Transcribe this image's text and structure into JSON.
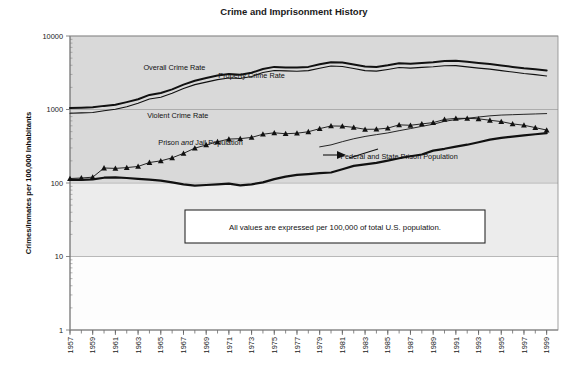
{
  "chart_data": {
    "type": "line",
    "title": "Crime and Imprisonment History",
    "xlabel": "",
    "ylabel": "Crimes/Inmates per 100,000 Inhabitants",
    "yscale": "log",
    "ylim": [
      1,
      10000
    ],
    "ytick_labels": [
      "10000",
      "1000",
      "100",
      "10",
      "1"
    ],
    "ytick_values": [
      10000,
      1000,
      100,
      10,
      1
    ],
    "xlim": [
      1957,
      2000
    ],
    "grid": true,
    "legend_position": "inline-annotations",
    "x": [
      1957,
      1958,
      1959,
      1960,
      1961,
      1962,
      1963,
      1964,
      1965,
      1966,
      1967,
      1968,
      1969,
      1970,
      1971,
      1972,
      1973,
      1974,
      1975,
      1976,
      1977,
      1978,
      1979,
      1980,
      1981,
      1982,
      1983,
      1984,
      1985,
      1986,
      1987,
      1988,
      1989,
      1990,
      1991,
      1992,
      1993,
      1994,
      1995,
      1996,
      1997,
      1998,
      1999
    ],
    "xtick_labels": [
      "1957",
      "1959",
      "1961",
      "1963",
      "1965",
      "1967",
      "1969",
      "1971",
      "1973",
      "1975",
      "1977",
      "1979",
      "1981",
      "1983",
      "1985",
      "1987",
      "1989",
      "1991",
      "1993",
      "1995",
      "1997",
      "1999"
    ],
    "series": [
      {
        "name": "Overall Crime Rate",
        "marker": "none",
        "stroke_width": 2.0,
        "color": "#111111",
        "label_x": 1966.2,
        "label_y": 3450,
        "values": [
          1050,
          1060,
          1070,
          1120,
          1160,
          1260,
          1380,
          1580,
          1680,
          1880,
          2180,
          2460,
          2680,
          2900,
          3050,
          2980,
          3160,
          3560,
          3800,
          3740,
          3720,
          3800,
          4120,
          4400,
          4350,
          4100,
          3840,
          3790,
          3990,
          4250,
          4190,
          4290,
          4390,
          4570,
          4600,
          4450,
          4290,
          4160,
          3980,
          3800,
          3640,
          3530,
          3400
        ]
      },
      {
        "name": "Property Crime Rate",
        "marker": "none",
        "stroke_width": 1.1,
        "color": "#111111",
        "label_x": 1973.0,
        "label_y": 2700,
        "values": [
          890,
          900,
          910,
          960,
          1010,
          1090,
          1220,
          1390,
          1470,
          1660,
          1930,
          2180,
          2360,
          2550,
          2680,
          2640,
          2810,
          3180,
          3400,
          3350,
          3320,
          3380,
          3650,
          3900,
          3850,
          3620,
          3380,
          3330,
          3510,
          3720,
          3660,
          3740,
          3810,
          3940,
          3950,
          3800,
          3660,
          3540,
          3380,
          3230,
          3090,
          2980,
          2860
        ]
      },
      {
        "name": "Violent Crime Rate",
        "marker": "triangle",
        "stroke_width": 0.9,
        "color": "#111111",
        "label_x": 1966.5,
        "label_y": 760,
        "values": [
          115,
          117,
          120,
          160,
          158,
          162,
          168,
          190,
          200,
          220,
          253,
          298,
          329,
          364,
          396,
          401,
          417,
          461,
          482,
          468,
          476,
          498,
          549,
          597,
          594,
          571,
          538,
          539,
          558,
          618,
          610,
          637,
          663,
          732,
          758,
          758,
          747,
          714,
          685,
          637,
          611,
          567,
          525
        ]
      },
      {
        "name": "Prison and Jail Population",
        "marker": "none",
        "stroke_width": 0.9,
        "color": "#111111",
        "label_x": 1968.5,
        "label_y": 330,
        "annotation_arrow": true,
        "values": [
          null,
          null,
          null,
          null,
          null,
          null,
          null,
          null,
          null,
          null,
          null,
          null,
          null,
          null,
          null,
          null,
          null,
          null,
          null,
          null,
          null,
          null,
          310,
          330,
          365,
          400,
          430,
          455,
          480,
          515,
          550,
          590,
          630,
          690,
          730,
          760,
          790,
          820,
          840,
          850,
          860,
          870,
          880
        ]
      },
      {
        "name": "Federal and State Prison Population",
        "marker": "none",
        "stroke_width": 2.2,
        "color": "#111111",
        "label_x": 1986.0,
        "label_y": 215,
        "values": [
          110,
          110,
          112,
          118,
          119,
          117,
          114,
          111,
          108,
          102,
          96,
          92,
          94,
          96,
          98,
          93,
          96,
          102,
          113,
          122,
          129,
          132,
          136,
          139,
          154,
          171,
          179,
          188,
          202,
          217,
          231,
          244,
          276,
          292,
          313,
          332,
          359,
          389,
          411,
          427,
          444,
          461,
          476
        ]
      }
    ],
    "annotations": [
      {
        "name": "note-box",
        "text": "All values are expressed per 100,000 of total U.S. population."
      }
    ]
  }
}
